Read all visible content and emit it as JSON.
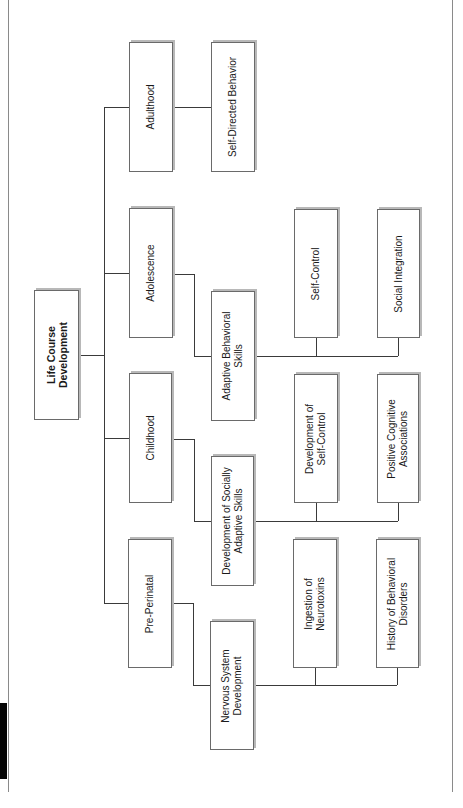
{
  "diagram": {
    "type": "hierarchy-tree",
    "orientation": "rotated-90-ccw",
    "root": {
      "label": "Life Course\nDevelopment"
    },
    "stages": [
      {
        "label": "Adulthood",
        "children": [
          {
            "label": "Self-Directed Behavior",
            "children": []
          }
        ]
      },
      {
        "label": "Adolescence",
        "children": [
          {
            "label": "Adaptive Behavioral\nSkills",
            "children": [
              {
                "label": "Self-Control"
              },
              {
                "label": "Social Integration"
              }
            ]
          }
        ]
      },
      {
        "label": "Childhood",
        "children": [
          {
            "label": "Development of Socially\nAdaptive Skills",
            "children": [
              {
                "label": "Development of\nSelf-Control"
              },
              {
                "label": "Positive Cognitive\nAssociations"
              }
            ]
          }
        ]
      },
      {
        "label": "Pre-Perinatal",
        "children": [
          {
            "label": "Nervous System\nDevelopment",
            "children": [
              {
                "label": "Ingestion of\nNeurotoxins"
              },
              {
                "label": "History of Behavioral\nDisorders"
              }
            ]
          }
        ]
      }
    ]
  },
  "colors": {
    "line": "#3a3a3a",
    "border": "#6a6a6a",
    "shadow": "#b8b8b8",
    "frame": "#8a8a8a"
  }
}
